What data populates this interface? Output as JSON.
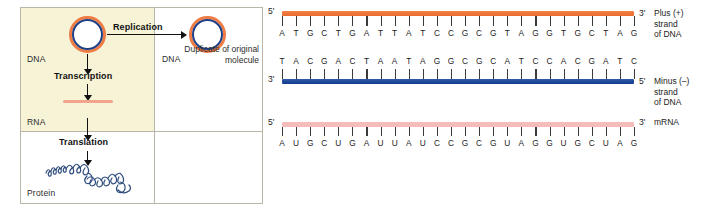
{
  "flow_panel": {
    "cells": {
      "dna_label": "DNA",
      "dna_duplicate_label": "DNA",
      "rna_label": "RNA",
      "protein_label": "Protein"
    },
    "duplicate_caption": "Duplicate of original molecule",
    "steps": {
      "replication": "Replication",
      "transcription": "Transcription",
      "translation": "Translation"
    },
    "icons": {
      "plasmid_original": "circular-dna-icon",
      "plasmid_duplicate": "circular-dna-duplicate-icon",
      "rna_bar": "linear-rna-icon",
      "protein": "protein-coil-icon"
    },
    "colors": {
      "panel_background_shaded": "#f7f3d7",
      "panel_background_plain": "#ffffff",
      "panel_border": "#b9b6a8",
      "plasmid_outer_ring": "#ef7b45",
      "plasmid_inner_ring": "#1d3f86",
      "rna_bar": "#f2a48c",
      "protein_ink": "#2c4a7c",
      "arrow": "#111111"
    }
  },
  "sequence_panel": {
    "plus_strand": {
      "five_prime": "5'",
      "three_prime": "3'",
      "caption": "Plus (+)\nstrand\nof DNA",
      "bases": [
        "A",
        "T",
        "G",
        "C",
        "T",
        "G",
        "A",
        "T",
        "T",
        "A",
        "T",
        "C",
        "C",
        "G",
        "C",
        "G",
        "T",
        "A",
        "G",
        "G",
        "T",
        "G",
        "C",
        "T",
        "A",
        "G"
      ],
      "color": "#ea6a2c"
    },
    "minus_strand": {
      "five_prime": "5'",
      "three_prime": "3'",
      "caption": "Minus (–)\nstrand\nof DNA",
      "bases": [
        "T",
        "A",
        "C",
        "G",
        "A",
        "C",
        "T",
        "A",
        "A",
        "T",
        "A",
        "G",
        "G",
        "C",
        "G",
        "C",
        "A",
        "T",
        "C",
        "C",
        "A",
        "C",
        "G",
        "A",
        "T",
        "C"
      ],
      "color": "#123c8c"
    },
    "mrna_strand": {
      "five_prime": "5'",
      "three_prime": "3'",
      "caption": "mRNA",
      "bases": [
        "A",
        "U",
        "G",
        "C",
        "U",
        "G",
        "A",
        "U",
        "U",
        "A",
        "U",
        "C",
        "C",
        "G",
        "C",
        "G",
        "U",
        "A",
        "G",
        "G",
        "U",
        "G",
        "C",
        "U",
        "A",
        "G"
      ],
      "color": "#f5bcbc"
    },
    "base_count": 26
  }
}
